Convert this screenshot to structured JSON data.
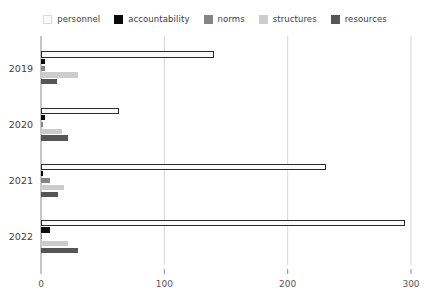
{
  "chart_data": {
    "type": "bar",
    "orientation": "horizontal",
    "title": "",
    "subtitle": "",
    "xlabel": "",
    "ylabel": "",
    "categories": [
      "2019",
      "2020",
      "2021",
      "2022"
    ],
    "xticks": [
      0,
      100,
      200,
      300
    ],
    "xtick_labels": [
      "0",
      "100",
      "200",
      "300"
    ],
    "xlim": [
      0,
      300
    ],
    "grid": true,
    "grid_axis": "x",
    "legend_position": "top",
    "series": [
      {
        "name": "personnel",
        "color": "#fbfbfb",
        "edge_color": "#2b2b2b",
        "values": [
          140,
          63,
          231,
          295
        ]
      },
      {
        "name": "accountability",
        "color": "#0a0a0a",
        "edge_color": "#0a0a0a",
        "values": [
          3,
          3,
          2,
          7
        ]
      },
      {
        "name": "norms",
        "color": "#858585",
        "edge_color": "#858585",
        "values": [
          3,
          2,
          7,
          1
        ]
      },
      {
        "name": "structures",
        "color": "#cccccc",
        "edge_color": "#cccccc",
        "values": [
          30,
          17,
          19,
          22
        ]
      },
      {
        "name": "resources",
        "color": "#565656",
        "edge_color": "#565656",
        "values": [
          13,
          22,
          14,
          30
        ]
      }
    ]
  },
  "legend": {
    "items": [
      {
        "label": "personnel"
      },
      {
        "label": "accountability"
      },
      {
        "label": "norms"
      },
      {
        "label": "structures"
      },
      {
        "label": "resources"
      }
    ]
  },
  "axes": {
    "x_axis_name": "value-axis",
    "y_axis_name": "year-axis"
  },
  "colors": {
    "background": "#ffffff",
    "grid": "#d6d6d6",
    "axis_line": "#8c8c8c",
    "tick_label": "#5a5a5a",
    "category_label": "#3d3d3d"
  }
}
